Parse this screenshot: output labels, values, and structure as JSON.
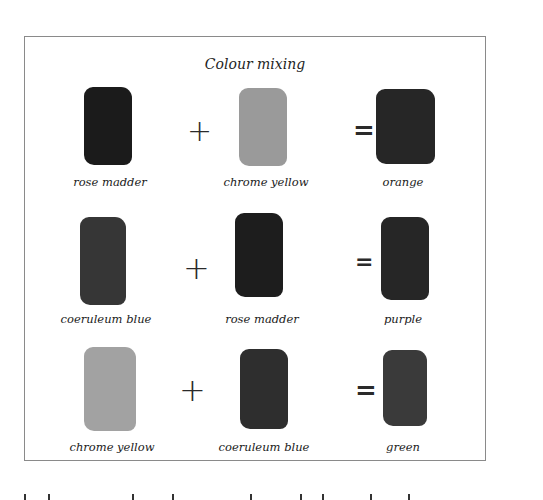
{
  "figure": {
    "title": "Colour mixing",
    "operators": {
      "plus": "+",
      "equals": "="
    },
    "rows": [
      {
        "inputs": [
          {
            "label": "rose madder",
            "shade": "#1b1b1b"
          },
          {
            "label": "chrome yellow",
            "shade": "#9a9a9a"
          }
        ],
        "result": {
          "label": "orange",
          "shade": "#262626"
        }
      },
      {
        "inputs": [
          {
            "label": "coeruleum blue",
            "shade": "#363636"
          },
          {
            "label": "rose madder",
            "shade": "#1d1d1d"
          }
        ],
        "result": {
          "label": "purple",
          "shade": "#262626"
        }
      },
      {
        "inputs": [
          {
            "label": "chrome yellow",
            "shade": "#a2a2a2"
          },
          {
            "label": "coeruleum blue",
            "shade": "#2e2e2e"
          }
        ],
        "result": {
          "label": "green",
          "shade": "#3a3a3a"
        }
      }
    ]
  }
}
